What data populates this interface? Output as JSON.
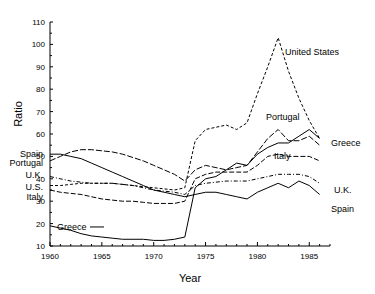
{
  "chart_data": {
    "type": "line",
    "title": "",
    "xlabel": "Year",
    "ylabel": "Ratio",
    "xlim": [
      1960,
      1987
    ],
    "ylim": [
      10,
      110
    ],
    "xticks": [
      1960,
      1965,
      1970,
      1975,
      1980,
      1985
    ],
    "xticklabels": [
      "1960",
      "1965",
      "1970",
      "1975",
      "1980",
      "1985"
    ],
    "yticks": [
      10,
      20,
      30,
      40,
      50,
      60,
      70,
      80,
      90,
      100,
      110
    ],
    "yticklabels": [
      "10",
      "20",
      "30",
      "40",
      "50",
      "60",
      "70",
      "80",
      "90",
      "100",
      "110"
    ],
    "grid": false,
    "legend_position": "inline-labels",
    "x": [
      1960,
      1961,
      1962,
      1963,
      1964,
      1965,
      1966,
      1967,
      1968,
      1969,
      1970,
      1971,
      1972,
      1973,
      1974,
      1975,
      1976,
      1977,
      1978,
      1979,
      1980,
      1981,
      1982,
      1983,
      1984,
      1985,
      1986
    ],
    "series": [
      {
        "name": "United States",
        "linestyle": "dashed",
        "label_left": "U.S.",
        "label_right": "United States",
        "values": [
          37,
          37,
          37.5,
          38,
          38,
          38,
          38,
          37.5,
          37,
          36.5,
          36,
          35.5,
          35,
          36,
          57,
          62,
          63,
          64,
          62,
          65,
          78,
          90,
          103,
          88,
          76,
          66,
          58
        ]
      },
      {
        "name": "Portugal",
        "linestyle": "dashed",
        "label_left": "Portugal",
        "label_right": "Portugal",
        "values": [
          48,
          50,
          52,
          53,
          53,
          52.5,
          52,
          51,
          49.5,
          48,
          46,
          44,
          42,
          39,
          44,
          46,
          45,
          44,
          45,
          46,
          52,
          58,
          62,
          57,
          57,
          59,
          55
        ]
      },
      {
        "name": "Greece",
        "linestyle": "solid",
        "label_left": "Greece",
        "label_right": "Greece",
        "values": [
          19,
          18,
          17,
          15.5,
          14.5,
          14,
          13.5,
          13,
          13,
          13,
          12.5,
          12.5,
          13,
          14,
          36,
          40,
          41,
          44,
          47,
          46,
          51,
          54,
          56,
          56,
          59,
          62,
          58
        ]
      },
      {
        "name": "Italy",
        "linestyle": "dashed",
        "label_left": "Italy",
        "label_right": "Italy",
        "values": [
          35,
          34,
          33.5,
          33,
          32,
          31,
          30.5,
          30,
          30,
          29.5,
          29,
          29,
          29,
          30,
          40,
          42,
          43,
          43,
          43,
          43,
          46,
          50,
          51,
          50,
          50,
          50,
          48
        ]
      },
      {
        "name": "U.K.",
        "linestyle": "dashed",
        "label_left": "U.K.",
        "label_right": "U.K.",
        "values": [
          41,
          40,
          39,
          38.5,
          38,
          38,
          38,
          37.5,
          37,
          36,
          35,
          34.5,
          34,
          33,
          37,
          38,
          38.5,
          39,
          39,
          39,
          40,
          41,
          42,
          42,
          42,
          41,
          38
        ]
      },
      {
        "name": "Spain",
        "linestyle": "solid",
        "label_left": "Spain",
        "label_right": "Spain",
        "values": [
          51,
          51,
          50,
          49,
          47,
          45,
          43,
          41,
          39,
          37,
          35,
          34,
          33,
          32,
          33,
          34,
          34,
          33,
          32,
          31,
          34,
          36,
          38,
          36,
          39,
          37,
          33
        ]
      }
    ]
  },
  "labels": {
    "left_axis_labels": [
      "Spain",
      "Portugal",
      "U.K.",
      "U.S.",
      "Italy"
    ],
    "inline_greece": "Greece",
    "right_labels": [
      "United States",
      "Portugal",
      "Greece",
      "Italy",
      "U.K.",
      "Spain"
    ]
  }
}
